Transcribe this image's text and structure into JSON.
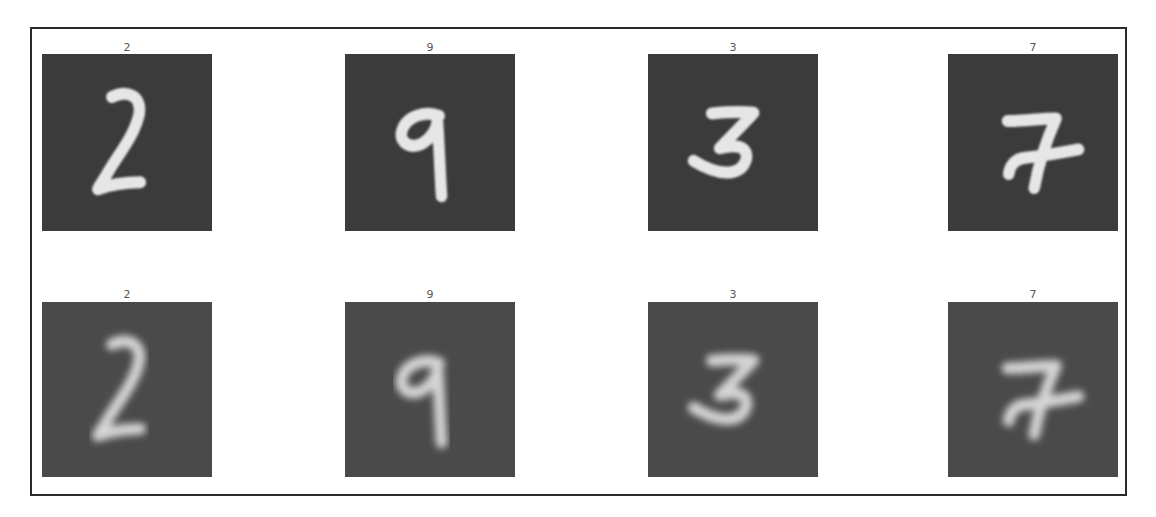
{
  "figure": {
    "rows": [
      {
        "name": "original",
        "panel_color": "#3b3b3b",
        "stroke_color": "#e6e6e6",
        "stroke_blur": 0.6,
        "items": [
          {
            "label": "2"
          },
          {
            "label": "9"
          },
          {
            "label": "3"
          },
          {
            "label": "7"
          }
        ]
      },
      {
        "name": "reconstructed",
        "panel_color": "#4a4a4a",
        "stroke_color": "#d4d4d4",
        "stroke_blur": 2.2,
        "items": [
          {
            "label": "2"
          },
          {
            "label": "9"
          },
          {
            "label": "3"
          },
          {
            "label": "7"
          }
        ]
      }
    ]
  }
}
